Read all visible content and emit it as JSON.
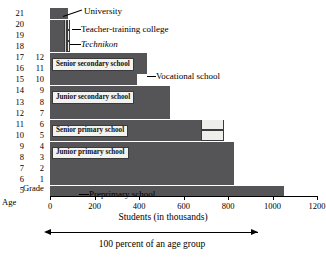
{
  "chart_data": {
    "type": "bar",
    "orientation": "horizontal",
    "title": "",
    "xlabel": "Students (in thousands)",
    "ylabel": "Age",
    "xlim": [
      0,
      1200
    ],
    "xticks": [
      0,
      200,
      400,
      600,
      800,
      1000,
      1200
    ],
    "xticklabels": [
      "0",
      "200",
      "400",
      "600",
      "800",
      "1000",
      "1200"
    ],
    "grid": false,
    "legend": "none",
    "annotation": "100 percent of an age group",
    "axis_headers": {
      "age": "Age",
      "grade": "Grade"
    },
    "age_ticks": [
      "21",
      "20",
      "19",
      "18",
      "17",
      "16",
      "15",
      "14",
      "13",
      "12",
      "11",
      "10",
      "9",
      "8",
      "7",
      "6",
      "5"
    ],
    "grade_ticks": [
      "12",
      "11",
      "10",
      "9",
      "8",
      "7",
      "6",
      "5",
      "4",
      "3",
      "2",
      "1"
    ],
    "bands": [
      {
        "age": "21",
        "grade": "",
        "segments": [
          {
            "label": "University",
            "value": 80,
            "style": "dark"
          }
        ]
      },
      {
        "age": "20",
        "grade": "",
        "segments": [
          {
            "label": "University",
            "value": 65,
            "style": "dark"
          },
          {
            "label": "Technikon",
            "value": 13,
            "style": "mid"
          },
          {
            "label": "Teacher-training college",
            "value": 12,
            "style": "light"
          }
        ]
      },
      {
        "age": "19",
        "grade": "",
        "segments": [
          {
            "label": "University",
            "value": 65,
            "style": "dark"
          },
          {
            "label": "Technikon",
            "value": 13,
            "style": "mid"
          },
          {
            "label": "Teacher-training college",
            "value": 12,
            "style": "light"
          }
        ]
      },
      {
        "age": "18",
        "grade": "",
        "segments": [
          {
            "label": "University",
            "value": 65,
            "style": "dark"
          },
          {
            "label": "Technikon",
            "value": 13,
            "style": "mid"
          },
          {
            "label": "Teacher-training college",
            "value": 12,
            "style": "light"
          }
        ]
      },
      {
        "age": "17",
        "grade": "12",
        "segments": [
          {
            "label": "Senior secondary school",
            "value": 390,
            "style": "dark"
          },
          {
            "label": "Vocational school",
            "value": 45,
            "style": "dark"
          }
        ]
      },
      {
        "age": "16",
        "grade": "11",
        "segments": [
          {
            "label": "Senior secondary school",
            "value": 390,
            "style": "dark"
          },
          {
            "label": "Vocational school",
            "value": 45,
            "style": "dark"
          }
        ]
      },
      {
        "age": "15",
        "grade": "10",
        "segments": [
          {
            "label": "Senior secondary school",
            "value": 390,
            "style": "dark"
          }
        ]
      },
      {
        "age": "14",
        "grade": "9",
        "segments": [
          {
            "label": "Junior secondary school",
            "value": 540,
            "style": "dark"
          }
        ]
      },
      {
        "age": "13",
        "grade": "8",
        "segments": [
          {
            "label": "Junior secondary school",
            "value": 540,
            "style": "dark"
          }
        ]
      },
      {
        "age": "12",
        "grade": "7",
        "segments": [
          {
            "label": "Junior secondary school",
            "value": 540,
            "style": "dark"
          }
        ]
      },
      {
        "age": "11",
        "grade": "6",
        "segments": [
          {
            "label": "Senior primary school",
            "value": 680,
            "style": "dark"
          },
          {
            "label": "",
            "value": 100,
            "style": "light"
          }
        ]
      },
      {
        "age": "10",
        "grade": "5",
        "segments": [
          {
            "label": "Senior primary school",
            "value": 680,
            "style": "dark"
          },
          {
            "label": "",
            "value": 100,
            "style": "light"
          }
        ]
      },
      {
        "age": "9",
        "grade": "4",
        "segments": [
          {
            "label": "Junior primary school",
            "value": 825,
            "style": "dark"
          }
        ]
      },
      {
        "age": "8",
        "grade": "3",
        "segments": [
          {
            "label": "Junior primary school",
            "value": 825,
            "style": "dark"
          }
        ]
      },
      {
        "age": "7",
        "grade": "2",
        "segments": [
          {
            "label": "Junior primary school",
            "value": 825,
            "style": "dark"
          }
        ]
      },
      {
        "age": "6",
        "grade": "1",
        "segments": [
          {
            "label": "Junior primary school",
            "value": 825,
            "style": "dark"
          }
        ]
      },
      {
        "age": "5",
        "grade": "",
        "segments": [
          {
            "label": "Preprimary school",
            "value": 1050,
            "style": "dark"
          }
        ]
      }
    ],
    "callouts": [
      {
        "name": "university",
        "label": "University"
      },
      {
        "name": "teacher-training-college",
        "label": "Teacher-training college"
      },
      {
        "name": "technikon",
        "label": "Technikon",
        "italic": true
      },
      {
        "name": "vocational-school",
        "label": "Vocational school"
      },
      {
        "name": "preprimary-school",
        "label": "Preprimary school"
      }
    ],
    "inbar_labels": [
      {
        "name": "senior-secondary-school",
        "label": "Senior secondary school"
      },
      {
        "name": "junior-secondary-school",
        "label": "Junior secondary school"
      },
      {
        "name": "senior-primary-school",
        "label": "Senior primary school"
      },
      {
        "name": "junior-primary-school",
        "label": "Junior primary school"
      }
    ]
  },
  "colors": {
    "bar_dark": "#555557",
    "bar_light": "#eeeeec",
    "bar_mid": "#c9c9c6",
    "axis": "#000000",
    "background": "#ffffff"
  }
}
